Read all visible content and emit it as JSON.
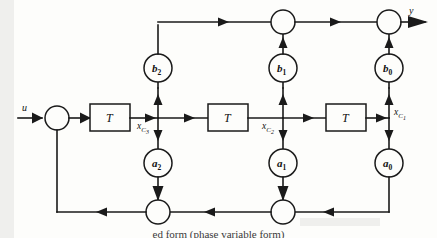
{
  "figure": {
    "type": "signal-flow-block-diagram",
    "caption": "ed form (phase variable form)",
    "background_color": "#fdfdfb",
    "line_color": "#1a1a1a"
  },
  "io": {
    "input_label": "u",
    "output_label": "y"
  },
  "delay_blocks": [
    {
      "id": "delay-1",
      "label": "T"
    },
    {
      "id": "delay-2",
      "label": "T"
    },
    {
      "id": "delay-3",
      "label": "T"
    }
  ],
  "feedforward_gains": [
    {
      "id": "gain-b2",
      "label": "b",
      "subscript": "2"
    },
    {
      "id": "gain-b1",
      "label": "b",
      "subscript": "1"
    },
    {
      "id": "gain-b0",
      "label": "b",
      "subscript": "0"
    }
  ],
  "feedback_gains": [
    {
      "id": "gain-a2",
      "label": "a",
      "subscript": "2"
    },
    {
      "id": "gain-a1",
      "label": "a",
      "subscript": "1"
    },
    {
      "id": "gain-a0",
      "label": "a",
      "subscript": "0"
    }
  ],
  "state_labels": [
    {
      "id": "state-xc3",
      "base": "x",
      "sub": "C",
      "subsub": "3"
    },
    {
      "id": "state-xc2",
      "base": "x",
      "sub": "C",
      "subsub": "2"
    },
    {
      "id": "state-xc1",
      "base": "x",
      "sub": "C",
      "subsub": "1"
    }
  ],
  "summing_junctions": [
    {
      "id": "sum-input",
      "position": "left-input"
    },
    {
      "id": "sum-top-middle",
      "position": "top-middle"
    },
    {
      "id": "sum-top-right",
      "position": "top-right"
    },
    {
      "id": "sum-bottom-left",
      "position": "bottom-left"
    },
    {
      "id": "sum-bottom-middle",
      "position": "bottom-middle"
    }
  ]
}
